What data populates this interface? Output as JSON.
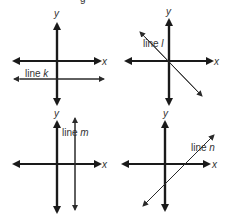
{
  "title_fragment": "g",
  "panels": [
    {
      "id": "k",
      "line_label": "line",
      "line_name": "k",
      "x_axis": "x",
      "y_axis": "y",
      "description": "horizontal line below x-axis"
    },
    {
      "id": "l",
      "line_label": "line",
      "line_name": "l",
      "x_axis": "x",
      "y_axis": "y",
      "description": "line through origin with negative slope"
    },
    {
      "id": "m",
      "line_label": "line",
      "line_name": "m",
      "x_axis": "x",
      "y_axis": "y",
      "description": "vertical line right of y-axis"
    },
    {
      "id": "n",
      "line_label": "line",
      "line_name": "n",
      "x_axis": "x",
      "y_axis": "y",
      "description": "line with positive slope crossing x-axis right of origin"
    }
  ],
  "colors": {
    "axis": "#1a1a1a",
    "line": "#2a2a2a",
    "text": "#333333"
  }
}
